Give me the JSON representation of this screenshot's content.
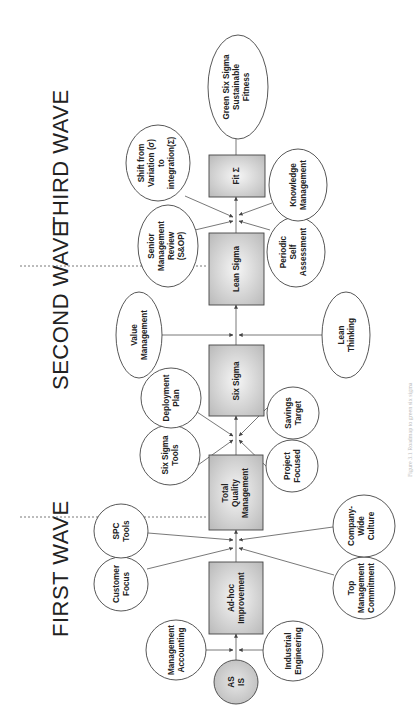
{
  "waves": [
    {
      "id": "first",
      "label": "FIRST WAVE"
    },
    {
      "id": "second",
      "label": "SECOND WAVE"
    },
    {
      "id": "third",
      "label": "THIRD WAVE"
    }
  ],
  "start": {
    "lines": [
      "AS",
      "IS"
    ]
  },
  "stages": [
    {
      "id": "adhoc",
      "lines": [
        "Ad-hoc",
        "Improvement"
      ]
    },
    {
      "id": "tqm",
      "lines": [
        "Total",
        "Quality",
        "Management"
      ]
    },
    {
      "id": "sixsigma",
      "lines": [
        "Six Sigma"
      ]
    },
    {
      "id": "leansigma",
      "lines": [
        "Lean Sigma"
      ]
    },
    {
      "id": "fitsigma",
      "lines": [
        "Fit Σ"
      ]
    }
  ],
  "end": {
    "lines": [
      "Green Six Sigma",
      "Sustainable",
      "Fitness"
    ]
  },
  "inputs": [
    {
      "id": "mgmt-accounting",
      "target": "adhoc",
      "lines": [
        "Management",
        "Accounting"
      ]
    },
    {
      "id": "industrial-eng",
      "target": "adhoc",
      "lines": [
        "Industrial",
        "Engineering"
      ]
    },
    {
      "id": "customer-focus",
      "target": "tqm",
      "lines": [
        "Customer",
        "Focus"
      ]
    },
    {
      "id": "spc-tools",
      "target": "tqm",
      "lines": [
        "SPC",
        "Tools"
      ]
    },
    {
      "id": "top-mgmt",
      "target": "tqm",
      "lines": [
        "Top",
        "Management",
        "Commitment"
      ]
    },
    {
      "id": "company-culture",
      "target": "tqm",
      "lines": [
        "Company-",
        "Wide",
        "Culture"
      ]
    },
    {
      "id": "ss-tools",
      "target": "sixsigma",
      "lines": [
        "Six Sigma",
        "Tools"
      ]
    },
    {
      "id": "deployment-plan",
      "target": "sixsigma",
      "lines": [
        "Deployment",
        "Plan"
      ]
    },
    {
      "id": "project-focused",
      "target": "sixsigma",
      "lines": [
        "Project",
        "Focused"
      ]
    },
    {
      "id": "savings-target",
      "target": "sixsigma",
      "lines": [
        "Savings",
        "Target"
      ]
    },
    {
      "id": "value-mgmt",
      "target": "leansigma",
      "lines": [
        "Value",
        "Management"
      ]
    },
    {
      "id": "lean-thinking",
      "target": "leansigma",
      "lines": [
        "Lean",
        "Thinking"
      ]
    },
    {
      "id": "senior-review",
      "target": "fitsigma",
      "lines": [
        "Senior",
        "Management",
        "Review",
        "(S&OP)"
      ]
    },
    {
      "id": "shift-variation",
      "target": "fitsigma",
      "lines": [
        "Shift from",
        "Variation (σ)",
        "to",
        "integration(Σ)"
      ]
    },
    {
      "id": "periodic-assess",
      "target": "fitsigma",
      "lines": [
        "Periodic",
        "Self",
        "Assessment"
      ]
    },
    {
      "id": "knowledge-mgmt",
      "target": "fitsigma",
      "lines": [
        "Knowledge",
        "Management"
      ]
    }
  ],
  "caption": "Figure 3.1 Roadmap to green six sigma",
  "colors": {
    "stroke": "#444444",
    "box_fill_center": "#f4f4f4",
    "box_fill_edge": "#bdbdbd",
    "text": "#222222"
  }
}
